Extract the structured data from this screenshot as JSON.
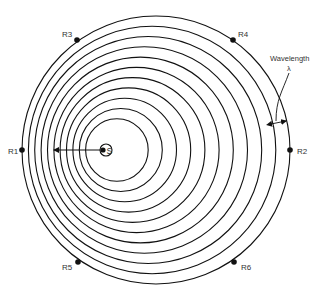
{
  "diagram": {
    "colors": {
      "stroke": "#111111",
      "text": "#333333",
      "background": "#ffffff"
    },
    "source": {
      "label": "S",
      "x": 103,
      "y": 150
    },
    "motion_arrow": {
      "from_x": 100,
      "to_x": 53,
      "y": 150,
      "direction": "left"
    },
    "wavefront_count": 12,
    "receivers": [
      {
        "id": "R1",
        "label": "R1",
        "x": 22,
        "y": 150,
        "label_x": 8,
        "label_y": 154
      },
      {
        "id": "R2",
        "label": "R2",
        "x": 290,
        "y": 150,
        "label_x": 297,
        "label_y": 154
      },
      {
        "id": "R3",
        "label": "R3",
        "x": 77,
        "y": 40,
        "label_x": 62,
        "label_y": 37
      },
      {
        "id": "R4",
        "label": "R4",
        "x": 233,
        "y": 40,
        "label_x": 238,
        "label_y": 37
      },
      {
        "id": "R5",
        "label": "R5",
        "x": 78,
        "y": 262,
        "label_x": 62,
        "label_y": 270
      },
      {
        "id": "R6",
        "label": "R6",
        "x": 234,
        "y": 262,
        "label_x": 241,
        "label_y": 270
      }
    ],
    "wavelength_label": {
      "line1": "Wavelength",
      "line2": "λ"
    }
  }
}
